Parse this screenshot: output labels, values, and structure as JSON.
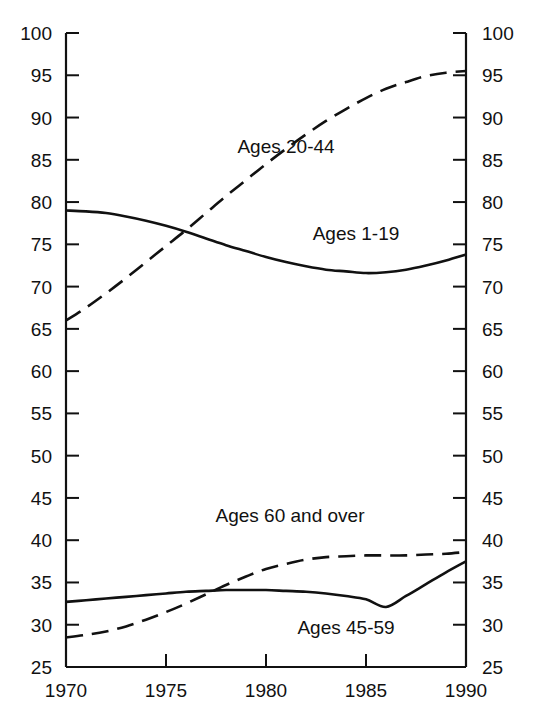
{
  "chart_data": {
    "type": "line",
    "title": "",
    "subtitle": "",
    "xlabel": "",
    "ylabel": "",
    "xlim": [
      1970,
      1990
    ],
    "ylim": [
      25,
      100
    ],
    "grid": false,
    "legend_position": "inline-annotations",
    "x_ticks": [
      1970,
      1975,
      1980,
      1985,
      1990
    ],
    "y_ticks": [
      25,
      30,
      35,
      40,
      45,
      50,
      55,
      60,
      65,
      70,
      75,
      80,
      85,
      90,
      95,
      100
    ],
    "y_axis_both_sides": true,
    "x": [
      1970,
      1971,
      1972,
      1973,
      1974,
      1975,
      1976,
      1977,
      1978,
      1979,
      1980,
      1981,
      1982,
      1983,
      1984,
      1985,
      1986,
      1987,
      1988,
      1989,
      1990
    ],
    "series": [
      {
        "name": "Ages 1-19",
        "style": "solid",
        "color": "#111111",
        "values": [
          79.0,
          78.9,
          78.7,
          78.3,
          77.8,
          77.2,
          76.5,
          75.7,
          74.9,
          74.2,
          73.5,
          72.9,
          72.4,
          72.0,
          71.8,
          71.6,
          71.7,
          72.0,
          72.5,
          73.1,
          73.8
        ]
      },
      {
        "name": "Ages 20-44",
        "style": "dashed",
        "color": "#111111",
        "values": [
          66.0,
          67.5,
          69.2,
          71.0,
          72.9,
          74.8,
          76.7,
          78.7,
          80.7,
          82.6,
          84.5,
          86.3,
          88.0,
          89.6,
          91.0,
          92.3,
          93.4,
          94.2,
          94.9,
          95.3,
          95.5
        ]
      },
      {
        "name": "Ages 45-59",
        "style": "solid",
        "color": "#111111",
        "values": [
          32.7,
          32.9,
          33.1,
          33.3,
          33.5,
          33.7,
          33.9,
          34.0,
          34.1,
          34.1,
          34.1,
          34.0,
          33.9,
          33.7,
          33.4,
          33.0,
          32.1,
          33.4,
          34.8,
          36.2,
          37.5
        ]
      },
      {
        "name": "Ages 60 and over",
        "style": "dashed",
        "color": "#111111",
        "values": [
          28.5,
          28.8,
          29.2,
          29.8,
          30.6,
          31.5,
          32.5,
          33.6,
          34.7,
          35.7,
          36.6,
          37.2,
          37.7,
          38.0,
          38.1,
          38.2,
          38.2,
          38.2,
          38.3,
          38.4,
          38.6
        ]
      }
    ],
    "annotations": [
      {
        "text": "Ages 20-44",
        "x": 1981.0,
        "y": 86.5
      },
      {
        "text": "Ages 1-19",
        "x": 1984.5,
        "y": 76.2
      },
      {
        "text": "Ages 60 and over",
        "x": 1981.2,
        "y": 42.9
      },
      {
        "text": "Ages 45-59",
        "x": 1984.0,
        "y": 29.6
      }
    ]
  },
  "axes": {
    "y_left_labels": [
      "100",
      "95",
      "90",
      "85",
      "80",
      "75",
      "70",
      "65",
      "60",
      "55",
      "50",
      "45",
      "40",
      "35",
      "30",
      "25"
    ],
    "y_right_labels": [
      "100",
      "95",
      "90",
      "85",
      "80",
      "75",
      "70",
      "65",
      "60",
      "55",
      "50",
      "45",
      "40",
      "35",
      "30",
      "25"
    ],
    "x_labels": [
      "1970",
      "1975",
      "1980",
      "1985",
      "1990"
    ]
  }
}
